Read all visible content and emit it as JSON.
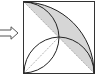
{
  "diagram": {
    "arrow": {
      "direction": "right",
      "icon": "right-arrow-icon"
    },
    "square": {
      "stroke": "#333333",
      "shade_color": "#d3d3d3",
      "diagonal_style": "dotted"
    }
  }
}
